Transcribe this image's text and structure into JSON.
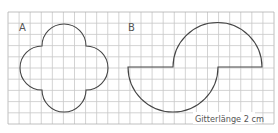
{
  "figure": {
    "labels": {
      "shape_a": "A",
      "shape_b": "B"
    },
    "caption": "Gitterlänge 2 cm",
    "grid": {
      "columns": 24,
      "rows": 10,
      "line_color": "#c8c8c8",
      "border_color": "#b0b0b0"
    },
    "shapes": [
      {
        "name": "A",
        "description": "four semicircles (radius 2 cells) on the sides of a 4x4 square",
        "stroke": "#444444"
      },
      {
        "name": "B",
        "description": "two semicircles (radius 4 cells) joined by two horizontal segments of 4 cells",
        "stroke": "#444444"
      }
    ]
  }
}
